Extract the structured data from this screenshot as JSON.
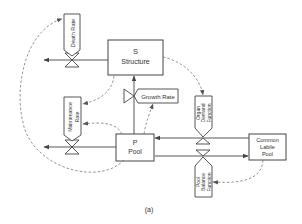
{
  "diagram": {
    "caption": "(a)",
    "colors": {
      "line": "#444444",
      "dashed": "#777777",
      "text": "#333333",
      "background": "#ffffff"
    },
    "boxes": {
      "structure": {
        "line1": "S",
        "line2": "Structure"
      },
      "pool": {
        "line1": "P",
        "line2": "Pool"
      },
      "common_labile_pool": {
        "line1": "Common",
        "line2": "Labile",
        "line3": "Pool"
      }
    },
    "rates": {
      "death_rate": {
        "label": "Death Rate"
      },
      "maintenance_rate": {
        "line1": "Maintenance",
        "line2": "Rate"
      },
      "growth_rate": {
        "label": "Growth Rate"
      },
      "organ_demand_function": {
        "line1": "Organ",
        "line2": "Demand",
        "line3": "Function"
      },
      "pool_balance_function": {
        "line1": "Pool",
        "line2": "Balance",
        "line3": "Function"
      }
    }
  }
}
